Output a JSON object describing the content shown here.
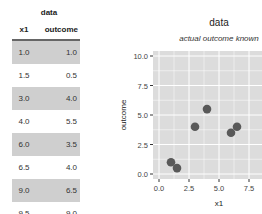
{
  "table": {
    "title": "data",
    "columns": [
      "x1",
      "outcome"
    ],
    "rows": [
      {
        "x1": "1.0",
        "outcome": "1.0",
        "shaded": true
      },
      {
        "x1": "1.5",
        "outcome": "0.5",
        "shaded": false
      },
      {
        "x1": "3.0",
        "outcome": "4.0",
        "shaded": true
      },
      {
        "x1": "4.0",
        "outcome": "5.5",
        "shaded": false
      },
      {
        "x1": "6.0",
        "outcome": "3.5",
        "shaded": true
      },
      {
        "x1": "6.5",
        "outcome": "4.0",
        "shaded": false
      },
      {
        "x1": "9.0",
        "outcome": "6.5",
        "shaded": true
      },
      {
        "x1": "9.5",
        "outcome": "9.0",
        "shaded": false
      }
    ]
  },
  "chart_data": {
    "type": "scatter",
    "title": "data",
    "subtitle": "actual outcome known",
    "xlabel": "x1",
    "ylabel": "outcome",
    "x": [
      1.0,
      1.5,
      3.0,
      4.0,
      6.0,
      6.5,
      9.0,
      9.5
    ],
    "y": [
      1.0,
      0.5,
      4.0,
      5.5,
      3.5,
      4.0,
      6.5,
      9.0
    ],
    "x_ticks": [
      "0.0",
      "2.5",
      "5.0",
      "7.5"
    ],
    "y_ticks": [
      "0.0",
      "2.5",
      "5.0",
      "7.5",
      "10.0"
    ],
    "xlim": [
      -0.5,
      10
    ],
    "ylim": [
      -0.5,
      10.3
    ],
    "grid": true,
    "point_color": "#595959",
    "panel_color": "#dcdcdc"
  }
}
